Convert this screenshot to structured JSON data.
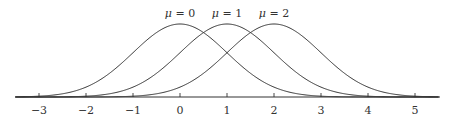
{
  "chart_data": {
    "type": "line",
    "title": "",
    "xlabel": "",
    "ylabel": "",
    "xlim": [
      -3.5,
      5.5
    ],
    "grid": false,
    "legend": "inline labels above peaks",
    "x_ticks": [
      -3,
      -2,
      -1,
      0,
      1,
      2,
      3,
      4,
      5
    ],
    "x_tick_labels": [
      "−3",
      "−2",
      "−1",
      "0",
      "1",
      "2",
      "3",
      "4",
      "5"
    ],
    "series": [
      {
        "name": "μ = 0",
        "mu": 0,
        "sigma": 1,
        "function": "gaussian"
      },
      {
        "name": "μ = 1",
        "mu": 1,
        "sigma": 1,
        "function": "gaussian"
      },
      {
        "name": "μ = 2",
        "mu": 2,
        "sigma": 1,
        "function": "gaussian"
      }
    ],
    "annotations": [
      {
        "text": "μ = 0",
        "x": 0
      },
      {
        "text": "μ = 1",
        "x": 1
      },
      {
        "text": "μ = 2",
        "x": 2
      }
    ]
  },
  "style": {
    "line_color": "#333333",
    "background": "#ffffff"
  }
}
